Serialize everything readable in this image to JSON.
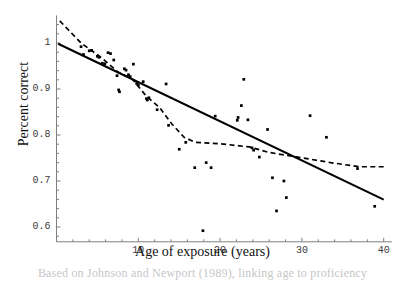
{
  "chart_data": {
    "type": "scatter",
    "title": "",
    "xlabel": "Age of exposure (years)",
    "ylabel": "Percent correct",
    "xlim": [
      0,
      41
    ],
    "ylim": [
      0.57,
      1.06
    ],
    "xticks": [
      10,
      20,
      30,
      40
    ],
    "yticks": [
      0.6,
      0.7,
      0.8,
      0.9,
      1
    ],
    "xtick_labels": [
      "10",
      "20",
      "30",
      "40"
    ],
    "ytick_labels": [
      "0.6",
      "0.7",
      "0.8",
      "0.9",
      "1"
    ],
    "grid": false,
    "legend": "none",
    "point_color": "#000000",
    "line_color": "#000000",
    "axis_color": "#808080",
    "points": [
      {
        "x": 3.0,
        "y": 0.992
      },
      {
        "x": 3.3,
        "y": 0.975
      },
      {
        "x": 4.0,
        "y": 0.983
      },
      {
        "x": 4.3,
        "y": 0.984
      },
      {
        "x": 5.0,
        "y": 0.971
      },
      {
        "x": 5.2,
        "y": 0.969
      },
      {
        "x": 5.6,
        "y": 0.956
      },
      {
        "x": 5.9,
        "y": 0.955
      },
      {
        "x": 6.3,
        "y": 0.979
      },
      {
        "x": 6.6,
        "y": 0.977
      },
      {
        "x": 7.0,
        "y": 0.963
      },
      {
        "x": 7.4,
        "y": 0.929
      },
      {
        "x": 7.6,
        "y": 0.898
      },
      {
        "x": 7.7,
        "y": 0.894
      },
      {
        "x": 8.3,
        "y": 0.944
      },
      {
        "x": 8.5,
        "y": 0.941
      },
      {
        "x": 8.8,
        "y": 0.931
      },
      {
        "x": 9.0,
        "y": 0.927
      },
      {
        "x": 9.4,
        "y": 0.954
      },
      {
        "x": 9.8,
        "y": 0.912
      },
      {
        "x": 10.0,
        "y": 0.909
      },
      {
        "x": 10.6,
        "y": 0.916
      },
      {
        "x": 11.0,
        "y": 0.879
      },
      {
        "x": 11.1,
        "y": 0.876
      },
      {
        "x": 11.3,
        "y": 0.881
      },
      {
        "x": 12.3,
        "y": 0.855
      },
      {
        "x": 13.4,
        "y": 0.911
      },
      {
        "x": 13.7,
        "y": 0.821
      },
      {
        "x": 15.0,
        "y": 0.769
      },
      {
        "x": 15.8,
        "y": 0.784
      },
      {
        "x": 16.9,
        "y": 0.729
      },
      {
        "x": 17.9,
        "y": 0.592
      },
      {
        "x": 18.3,
        "y": 0.74
      },
      {
        "x": 18.9,
        "y": 0.729
      },
      {
        "x": 19.4,
        "y": 0.841
      },
      {
        "x": 22.1,
        "y": 0.832
      },
      {
        "x": 22.2,
        "y": 0.838
      },
      {
        "x": 22.6,
        "y": 0.864
      },
      {
        "x": 22.9,
        "y": 0.921
      },
      {
        "x": 23.4,
        "y": 0.833
      },
      {
        "x": 23.9,
        "y": 0.772
      },
      {
        "x": 24.1,
        "y": 0.767
      },
      {
        "x": 24.8,
        "y": 0.752
      },
      {
        "x": 25.8,
        "y": 0.812
      },
      {
        "x": 26.4,
        "y": 0.707
      },
      {
        "x": 26.9,
        "y": 0.635
      },
      {
        "x": 27.8,
        "y": 0.7
      },
      {
        "x": 28.1,
        "y": 0.664
      },
      {
        "x": 31.0,
        "y": 0.842
      },
      {
        "x": 33.0,
        "y": 0.795
      },
      {
        "x": 36.8,
        "y": 0.727
      },
      {
        "x": 38.9,
        "y": 0.645
      }
    ],
    "regression_line": {
      "style": "solid",
      "points": [
        {
          "x": 0.2,
          "y": 0.9985
        },
        {
          "x": 40.0,
          "y": 0.6595
        }
      ]
    },
    "smoothed_line": {
      "style": "dashed",
      "points": [
        {
          "x": 0.4,
          "y": 1.048
        },
        {
          "x": 3.0,
          "y": 1.0
        },
        {
          "x": 5.5,
          "y": 0.968
        },
        {
          "x": 7.5,
          "y": 0.937
        },
        {
          "x": 9.3,
          "y": 0.921
        },
        {
          "x": 11.0,
          "y": 0.884
        },
        {
          "x": 12.6,
          "y": 0.86
        },
        {
          "x": 14.1,
          "y": 0.824
        },
        {
          "x": 15.6,
          "y": 0.795
        },
        {
          "x": 17.0,
          "y": 0.784
        },
        {
          "x": 20.0,
          "y": 0.781
        },
        {
          "x": 23.6,
          "y": 0.774
        },
        {
          "x": 26.0,
          "y": 0.762
        },
        {
          "x": 29.5,
          "y": 0.752
        },
        {
          "x": 33.5,
          "y": 0.74
        },
        {
          "x": 37.0,
          "y": 0.731
        },
        {
          "x": 40.0,
          "y": 0.731
        }
      ]
    }
  },
  "figure": {
    "x_axis_title": "Age of exposure (years)",
    "y_axis_title": "Percent correct",
    "caption": "Based on Johnson and Newport (1989), linking age to proficiency"
  }
}
